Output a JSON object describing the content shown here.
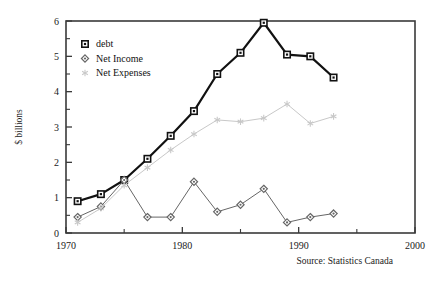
{
  "chart_data": {
    "type": "line",
    "title": "",
    "xlabel": "",
    "ylabel": "$ billions",
    "xlim": [
      1970,
      2000
    ],
    "ylim": [
      0,
      6
    ],
    "grid": false,
    "legend_position": "top-left",
    "x_ticks": [
      1970,
      1980,
      1990,
      2000
    ],
    "x_tick_labels": [
      "1970",
      "1980",
      "1990",
      "2000"
    ],
    "x_minor_ticks": [
      1975,
      1985,
      1995
    ],
    "y_ticks": [
      0,
      1,
      2,
      3,
      4,
      5,
      6
    ],
    "y_tick_labels": [
      "0",
      "1",
      "2",
      "3",
      "4",
      "5",
      "6"
    ],
    "y_minor_ticks": [
      0.5,
      1.5,
      2.5,
      3.5,
      4.5,
      5.5
    ],
    "annotation": "Source: Statistics Canada",
    "series": [
      {
        "name": "debt",
        "color": "#111111",
        "marker": "square",
        "line_width": 2.2,
        "x": [
          1971,
          1973,
          1975,
          1977,
          1979,
          1981,
          1983,
          1985,
          1987,
          1989,
          1991,
          1993
        ],
        "values": [
          0.9,
          1.1,
          1.5,
          2.1,
          2.75,
          3.45,
          4.5,
          5.1,
          5.95,
          5.05,
          5.0,
          4.4
        ]
      },
      {
        "name": "Net Income",
        "color": "#666666",
        "marker": "diamond",
        "line_width": 1.0,
        "x": [
          1971,
          1973,
          1975,
          1977,
          1979,
          1981,
          1983,
          1985,
          1987,
          1989,
          1991,
          1993
        ],
        "values": [
          0.45,
          0.75,
          1.5,
          0.45,
          0.45,
          1.45,
          0.6,
          0.8,
          1.25,
          0.3,
          0.45,
          0.55
        ]
      },
      {
        "name": "Net Expenses",
        "color": "#c8c8c8",
        "marker": "asterisk",
        "line_width": 1.0,
        "x": [
          1971,
          1973,
          1975,
          1977,
          1979,
          1981,
          1983,
          1985,
          1987,
          1989,
          1991,
          1993
        ],
        "values": [
          0.3,
          0.7,
          1.35,
          1.85,
          2.35,
          2.8,
          3.2,
          3.15,
          3.25,
          3.65,
          3.1,
          3.3
        ]
      }
    ]
  },
  "legend": {
    "items": [
      {
        "label": "debt"
      },
      {
        "label": "Net Income"
      },
      {
        "label": "Net Expenses"
      }
    ]
  },
  "axes": {
    "y_title": "$ billions"
  },
  "footer": {
    "source": "Source: Statistics Canada"
  }
}
